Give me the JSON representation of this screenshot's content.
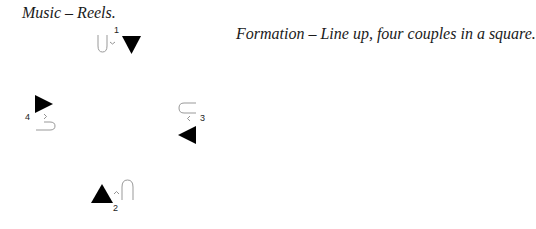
{
  "header": {
    "music": "Music – Reels.",
    "formation": "Formation – Line up, four couples in a square."
  },
  "couples": [
    {
      "number": "1",
      "man_facing": "down",
      "woman_marker": "loop",
      "position": "top"
    },
    {
      "number": "2",
      "man_facing": "up",
      "woman_marker": "loop",
      "position": "bottom"
    },
    {
      "number": "3",
      "man_facing": "left",
      "woman_marker": "loop",
      "position": "right"
    },
    {
      "number": "4",
      "man_facing": "right",
      "woman_marker": "loop",
      "position": "left"
    }
  ],
  "colors": {
    "man_marker": "#000000",
    "woman_marker": "#999999"
  }
}
